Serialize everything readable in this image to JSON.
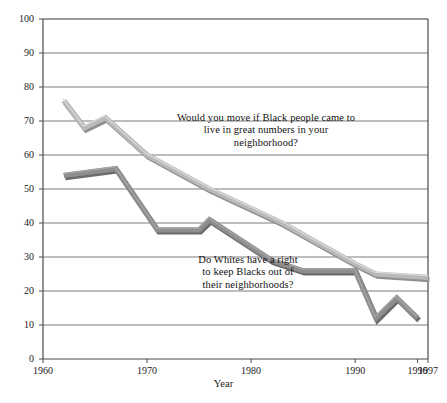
{
  "chart_data": {
    "type": "line",
    "title": "",
    "subtitle": "",
    "xlabel": "Year",
    "ylabel": "",
    "xlim": [
      1960,
      1997
    ],
    "ylim": [
      0,
      100
    ],
    "grid": true,
    "legend_position": "inline-annotations",
    "yticks": [
      0,
      10,
      20,
      30,
      40,
      50,
      60,
      70,
      80,
      90,
      100
    ],
    "ytick_labels": [
      "0",
      "10",
      "20",
      "30",
      "40",
      "50",
      "60",
      "70",
      "80",
      "90",
      "100"
    ],
    "xticks": [
      1960,
      1970,
      1980,
      1990,
      1996,
      1997
    ],
    "xtick_labels": [
      "1960",
      "1970",
      "1980",
      "1990",
      "1996",
      "1997"
    ],
    "series": [
      {
        "name": "Would you move if Black people came to live in great numbers in your neighborhood?",
        "color": "#b9b9b9",
        "x": [
          1962,
          1964,
          1966,
          1970,
          1976,
          1983,
          1990,
          1992,
          1997
        ],
        "values": [
          76,
          68,
          71,
          60,
          50,
          40,
          28,
          25,
          24
        ]
      },
      {
        "name": "Do Whites have a right to keep Blacks out of their neighborhoods?",
        "color": "#8e8e8e",
        "x": [
          1962,
          1967,
          1971,
          1975,
          1976,
          1982,
          1985,
          1990,
          1992,
          1994,
          1996
        ],
        "values": [
          54,
          56,
          38,
          38,
          41,
          29,
          26,
          26,
          12,
          18,
          12
        ]
      }
    ],
    "annotations": [
      {
        "id": "anno-upper",
        "text": "Would you move if Black people came to\nlive in great numbers in your\nneighborhood?",
        "series": "upper"
      },
      {
        "id": "anno-lower",
        "text": "Do Whites have a right\nto keep Blacks out of\ntheir neighborhoods?",
        "series": "lower"
      }
    ],
    "colors": {
      "upper_line": "#b9b9b9",
      "upper_line_shadow": "#8f8f8f",
      "lower_line": "#8e8e8e",
      "lower_line_shadow": "#6a6a6a",
      "gridline": "#6e6e6e",
      "axis": "#4a4a4a",
      "background": "#ffffff",
      "text": "#1a1a1a"
    }
  }
}
